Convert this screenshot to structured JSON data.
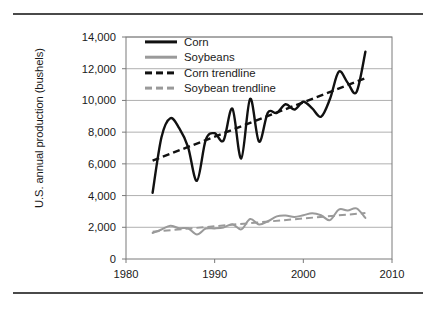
{
  "figure": {
    "has_top_rule": true,
    "has_bottom_rule": true
  },
  "legend": {
    "position": "top-left-inside",
    "items": [
      {
        "label": "Corn",
        "style": "solid",
        "color": "#111111"
      },
      {
        "label": "Soybeans",
        "style": "solid",
        "color": "#9a9a9a"
      },
      {
        "label": "Corn trendline",
        "style": "dashed",
        "color": "#111111"
      },
      {
        "label": "Soybean trendline",
        "style": "dashed",
        "color": "#9a9a9a"
      }
    ]
  },
  "chart_data": {
    "type": "line",
    "title": "",
    "xlabel": "",
    "ylabel": "U.S. annual production (bushels)",
    "xlim": [
      1980,
      2010
    ],
    "ylim": [
      0,
      14000
    ],
    "xticks": [
      1980,
      1990,
      2000,
      2010
    ],
    "xtick_labels": [
      "1980",
      "1990",
      "2000",
      "2010"
    ],
    "yticks": [
      0,
      2000,
      4000,
      6000,
      8000,
      10000,
      12000,
      14000
    ],
    "ytick_labels": [
      "0",
      "2,000",
      "4,000",
      "6,000",
      "8,000",
      "10,000",
      "12,000",
      "14,000"
    ],
    "grid": "horizontal",
    "legend_position": "upper left",
    "x": [
      1983,
      1984,
      1985,
      1986,
      1987,
      1988,
      1989,
      1990,
      1991,
      1992,
      1993,
      1994,
      1995,
      1996,
      1997,
      1998,
      1999,
      2000,
      2001,
      2002,
      2003,
      2004,
      2005,
      2006,
      2007
    ],
    "series": [
      {
        "name": "Corn",
        "color": "#111111",
        "style": "solid",
        "values": [
          4175,
          7675,
          8875,
          8250,
          7060,
          4930,
          7530,
          7930,
          7475,
          9480,
          6340,
          10100,
          7400,
          9230,
          9210,
          9760,
          9430,
          9915,
          9500,
          8970,
          10090,
          11810,
          11110,
          10530,
          13070
        ]
      },
      {
        "name": "Soybeans",
        "color": "#9a9a9a",
        "style": "solid",
        "values": [
          1640,
          1860,
          2100,
          1940,
          1940,
          1550,
          1920,
          1930,
          1990,
          2190,
          1870,
          2520,
          2180,
          2380,
          2690,
          2740,
          2650,
          2760,
          2890,
          2760,
          2450,
          3120,
          3060,
          3190,
          2590
        ]
      },
      {
        "name": "Corn trendline",
        "color": "#111111",
        "style": "dashed",
        "from": {
          "x": 1983,
          "y": 6200
        },
        "to": {
          "x": 2007,
          "y": 11400
        }
      },
      {
        "name": "Soybean trendline",
        "color": "#9a9a9a",
        "style": "dashed",
        "from": {
          "x": 1983,
          "y": 1720
        },
        "to": {
          "x": 2007,
          "y": 2900
        }
      }
    ]
  }
}
